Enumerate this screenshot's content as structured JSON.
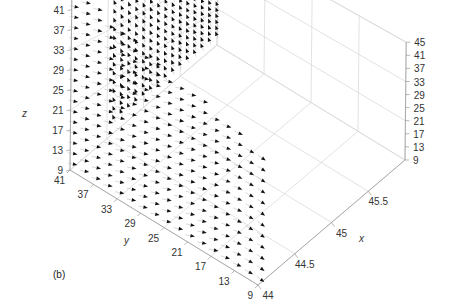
{
  "chart_data": {
    "type": "quiver3",
    "title": "",
    "panel_label": "(b)",
    "xlabel": "x",
    "ylabel": "y",
    "zlabel": "z",
    "x_ticks": [
      "44",
      "44.5",
      "45",
      "45.5"
    ],
    "y_ticks": [
      "41",
      "37",
      "33",
      "29",
      "25",
      "21",
      "17",
      "13",
      "9"
    ],
    "z_ticks_left": [
      "45",
      "41",
      "37",
      "33",
      "29",
      "25",
      "21",
      "17",
      "13",
      "9"
    ],
    "z_ticks_right": [
      "45",
      "41",
      "37",
      "33",
      "29",
      "25",
      "21",
      "17",
      "13",
      "9"
    ],
    "xlim": [
      44,
      46
    ],
    "ylim": [
      9,
      41
    ],
    "zlim": [
      9,
      45
    ],
    "grid": true,
    "slices": [
      {
        "plane": "x = 44 (y-z plane)",
        "direction": "arrows point toward +x, curving downward near y = 9"
      },
      {
        "plane": "y = 41 (x-z plane, back)",
        "direction": "arrows point upward (+z) and toward -x"
      }
    ]
  },
  "labels": {
    "x": "x",
    "y": "y",
    "z": "z",
    "panel": "(b)"
  }
}
